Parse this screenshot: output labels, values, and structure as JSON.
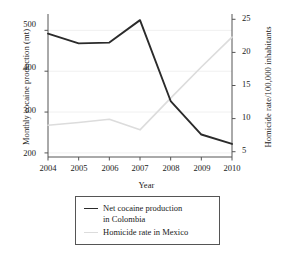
{
  "chart_data": {
    "type": "line",
    "title": "",
    "xlabel": "Year",
    "categories": [
      "2004",
      "2005",
      "2006",
      "2007",
      "2008",
      "2009",
      "2010"
    ],
    "x": [
      2004,
      2005,
      2006,
      2007,
      2008,
      2009,
      2010
    ],
    "grid": true,
    "legend_position": "below-plot",
    "axes": {
      "x": {
        "label": "Year",
        "ticks": [
          "2004",
          "2005",
          "2006",
          "2007",
          "2008",
          "2009",
          "2010"
        ],
        "min": 2004,
        "max": 2010
      },
      "y_left": {
        "label": "Monthly cocaine production (mt)",
        "ticks": [
          "200",
          "300",
          "400",
          "500"
        ],
        "tick_values": [
          200,
          300,
          400,
          500
        ],
        "min": 190,
        "max": 540
      },
      "y_right": {
        "label": "Homicide rate/100,000 inhabitants",
        "ticks": [
          "5",
          "10",
          "15",
          "20",
          "25"
        ],
        "tick_values": [
          5,
          10,
          15,
          20,
          25
        ],
        "min": 4.2,
        "max": 25.8
      }
    },
    "series": [
      {
        "name": "Net cocaine production in Colombia",
        "legend_label": "Net cocaine production\nin Colombia",
        "axis": "y_left",
        "color": "#2b2b2b",
        "values": [
          492,
          468,
          470,
          525,
          327,
          245,
          222
        ]
      },
      {
        "name": "Homicide rate in Mexico",
        "legend_label": "Homicide rate in Mexico",
        "axis": "y_right",
        "color": "#dcdcdc",
        "values": [
          9.0,
          9.4,
          9.9,
          8.3,
          13.1,
          17.8,
          22.3
        ]
      }
    ]
  },
  "legend": {
    "items": [
      {
        "label": "Net cocaine production\nin Colombia",
        "color": "#2b2b2b"
      },
      {
        "label": "Homicide rate in Mexico",
        "color": "#dcdcdc"
      }
    ]
  },
  "colors": {
    "series_cocaine": "#2b2b2b",
    "series_homicide": "#dcdcdc",
    "axis": "#555555",
    "grid": "#f0f0f0",
    "text": "#1a1a1a"
  }
}
